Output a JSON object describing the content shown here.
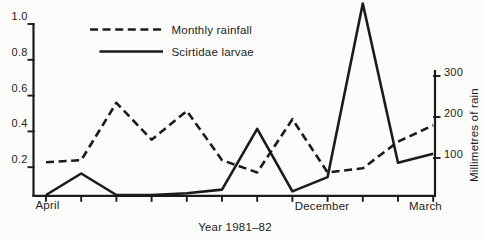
{
  "figure": {
    "legend": {
      "rainfall": "Monthly rainfall",
      "larvae": "Scirtidae larvae"
    },
    "x_axis": {
      "label_april": "April",
      "label_december": "December",
      "label_march": "March",
      "title": "Year 1981–82"
    },
    "right_axis": {
      "label": "Millimetres of rain"
    }
  },
  "chart_data": {
    "type": "line",
    "categories": [
      "Apr",
      "May",
      "Jun",
      "Jul",
      "Aug",
      "Sep",
      "Oct",
      "Nov",
      "Dec",
      "Jan",
      "Feb",
      "Mar"
    ],
    "x_tick_labels_shown": [
      "April",
      "December",
      "March"
    ],
    "xlabel": "Year 1981–82",
    "series": [
      {
        "name": "Monthly rainfall",
        "style": "dashed",
        "axis": "right",
        "values": [
          80,
          85,
          225,
          135,
          205,
          85,
          55,
          185,
          55,
          65,
          130,
          170
        ]
      },
      {
        "name": "Scirtidae larvae",
        "style": "solid",
        "axis": "left",
        "values": [
          0,
          0.12,
          0,
          0,
          0.01,
          0.03,
          0.37,
          0.02,
          0.1,
          1.07,
          0.18,
          0.23
        ]
      }
    ],
    "left_axis": {
      "range": [
        0,
        1.0
      ],
      "ticks": [
        1.0,
        0.8,
        0.6,
        0.4,
        0.2
      ]
    },
    "right_axis": {
      "label": "Millimetres of rain",
      "range": [
        0,
        300
      ],
      "ticks": [
        300,
        200,
        100
      ]
    },
    "legend_position": "top-left inside",
    "grid": false
  }
}
